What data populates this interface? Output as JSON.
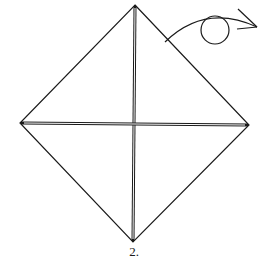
{
  "diagram": {
    "type": "origami-step",
    "step_label": "2.",
    "colors": {
      "line": "#1a1a1a",
      "background": "#ffffff"
    },
    "square": {
      "top": [
        135,
        5
      ],
      "right": [
        249,
        125
      ],
      "bottom": [
        133,
        242
      ],
      "left": [
        20,
        123
      ]
    },
    "creases": [
      "vertical-center-valley",
      "horizontal-center-valley"
    ],
    "symbols": [
      "turn-over-arrow"
    ]
  }
}
